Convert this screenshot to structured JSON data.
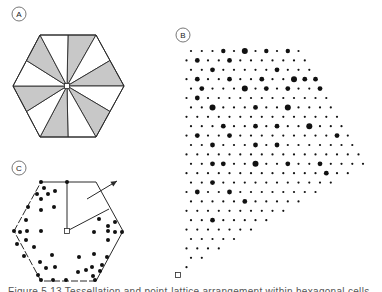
{
  "figure": {
    "panels": [
      {
        "id": "A",
        "label": "A",
        "label_pos": [
          19,
          14
        ],
        "description": "Hexagon divided into 12 triangles from center, alternating gray and white"
      },
      {
        "id": "B",
        "label": "B",
        "label_pos": [
          183,
          35
        ],
        "description": "Lattice of dots of varying sizes filling a wedge from origin square"
      },
      {
        "id": "C",
        "label": "C",
        "label_pos": [
          19,
          168
        ],
        "description": "Hexagon with scattered dots, center square, radial lines and an outward arrow"
      }
    ],
    "caption": "Figure 5.13  Tessellation and point-lattice arrangement within hexagonal cells"
  },
  "colors": {
    "stroke": "#2a2a2a",
    "shade": "#c8c8c8",
    "dot": "#111111",
    "background": "#ffffff"
  },
  "panelA": {
    "center": [
      67,
      86
    ],
    "vertices": [
      [
        40,
        35
      ],
      [
        96,
        35
      ],
      [
        124,
        86
      ],
      [
        96,
        137
      ],
      [
        40,
        137
      ],
      [
        13,
        86
      ]
    ],
    "shaded_sectors": [
      0,
      2,
      4,
      6,
      8,
      10
    ]
  },
  "panelB": {
    "origin": [
      178,
      275
    ],
    "row_y0": 51,
    "row_dy": 9.4,
    "rows": 24,
    "col_dx": 10.75,
    "even_x0": 191,
    "odd_x0": 186.5,
    "peak": [
      370,
      165
    ],
    "top_right": [
      308,
      51
    ],
    "big_dots": [
      [
        0,
        3,
        2.2
      ],
      [
        0,
        5,
        3
      ],
      [
        0,
        7,
        2.2
      ],
      [
        0,
        9,
        2.2
      ],
      [
        0,
        11,
        3
      ],
      [
        1,
        1,
        2.4
      ],
      [
        1,
        4,
        2.4
      ],
      [
        2,
        2,
        2.4
      ],
      [
        2,
        8,
        2.4
      ],
      [
        3,
        1,
        2.4
      ],
      [
        3,
        4,
        2.4
      ],
      [
        3,
        7,
        2.4
      ],
      [
        3,
        10,
        3
      ],
      [
        3,
        11,
        2.4
      ],
      [
        3,
        12,
        2.4
      ],
      [
        4,
        1,
        2.4
      ],
      [
        4,
        5,
        3
      ],
      [
        4,
        7,
        2.4
      ],
      [
        4,
        9,
        2.4
      ],
      [
        4,
        12,
        2.4
      ],
      [
        5,
        1,
        2.4
      ],
      [
        6,
        2,
        3
      ],
      [
        6,
        6,
        2.4
      ],
      [
        6,
        9,
        3
      ],
      [
        6,
        15,
        2.4
      ],
      [
        8,
        3,
        2.4
      ],
      [
        8,
        6,
        2.4
      ],
      [
        8,
        8,
        2.4
      ],
      [
        8,
        11,
        3
      ],
      [
        8,
        15,
        2.4
      ],
      [
        9,
        1,
        2.4
      ],
      [
        9,
        4,
        2.4
      ],
      [
        9,
        14,
        2.4
      ],
      [
        9,
        17,
        2.4
      ],
      [
        10,
        2,
        2.4
      ],
      [
        10,
        6,
        2.4
      ],
      [
        10,
        8,
        2.4
      ],
      [
        10,
        16,
        2.4
      ],
      [
        11,
        17,
        2.4
      ],
      [
        12,
        2,
        2.4
      ],
      [
        12,
        3,
        2.4
      ],
      [
        12,
        6,
        3
      ],
      [
        12,
        9,
        2.4
      ],
      [
        12,
        12,
        2.4
      ],
      [
        12,
        19,
        3
      ],
      [
        13,
        13,
        2.4
      ],
      [
        14,
        2,
        2.4
      ],
      [
        14,
        15,
        2.4
      ],
      [
        15,
        1,
        2.4
      ],
      [
        15,
        4,
        2.4
      ],
      [
        15,
        13,
        2.4
      ],
      [
        16,
        5,
        2.4
      ],
      [
        16,
        11,
        2.4
      ],
      [
        17,
        10,
        2.4
      ],
      [
        18,
        2,
        2.4
      ],
      [
        18,
        8,
        2.4
      ],
      [
        20,
        5,
        2.4
      ]
    ]
  },
  "panelC": {
    "center": [
      67,
      231
    ],
    "vertices": [
      [
        41,
        182
      ],
      [
        96,
        182
      ],
      [
        123,
        231
      ],
      [
        96,
        281
      ],
      [
        41,
        281
      ],
      [
        14,
        231
      ]
    ],
    "dashed_edges": [
      3,
      4,
      5
    ],
    "radial_lines": [
      [
        [
          67,
          231
        ],
        [
          67,
          182
        ]
      ],
      [
        [
          67,
          231
        ],
        [
          109,
          209
        ]
      ]
    ],
    "arrow": {
      "from": [
        87,
        199
      ],
      "to": [
        117,
        181
      ]
    },
    "dots": [
      [
        41,
        182
      ],
      [
        67,
        182
      ],
      [
        44,
        188
      ],
      [
        37,
        194
      ],
      [
        48,
        194
      ],
      [
        55,
        191
      ],
      [
        41,
        199
      ],
      [
        54,
        207
      ],
      [
        28,
        207
      ],
      [
        41,
        210
      ],
      [
        26,
        220
      ],
      [
        14,
        231
      ],
      [
        20,
        232
      ],
      [
        27,
        231
      ],
      [
        41,
        231
      ],
      [
        26,
        240
      ],
      [
        17,
        244
      ],
      [
        34,
        247
      ],
      [
        24,
        256
      ],
      [
        52,
        255
      ],
      [
        40,
        262
      ],
      [
        46,
        268
      ],
      [
        55,
        267
      ],
      [
        38,
        275
      ],
      [
        41,
        280
      ],
      [
        53,
        280
      ],
      [
        66,
        280
      ],
      [
        99,
        219
      ],
      [
        115,
        222
      ],
      [
        108,
        226
      ],
      [
        94,
        232
      ],
      [
        108,
        231
      ],
      [
        115,
        232
      ],
      [
        122,
        232
      ],
      [
        108,
        240
      ],
      [
        79,
        257
      ],
      [
        94,
        254
      ],
      [
        107,
        257
      ],
      [
        92,
        267
      ],
      [
        78,
        272
      ],
      [
        86,
        270
      ],
      [
        93,
        276
      ],
      [
        100,
        271
      ],
      [
        102,
        265
      ],
      [
        95,
        280
      ]
    ]
  }
}
